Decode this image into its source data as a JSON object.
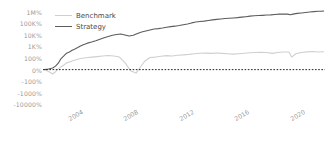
{
  "chart_data": {
    "type": "line",
    "title": "",
    "xlabel": "",
    "ylabel": "",
    "grid": false,
    "legend_position": "upper-left",
    "yscale": "symlog",
    "yticks": [
      {
        "label": "1M%",
        "value": 1000000
      },
      {
        "label": "100K%",
        "value": 100000
      },
      {
        "label": "10K%",
        "value": 10000
      },
      {
        "label": "1K%",
        "value": 1000
      },
      {
        "label": "100%",
        "value": 100
      },
      {
        "label": "0%",
        "value": 0
      },
      {
        "label": "-100%",
        "value": -100
      },
      {
        "label": "-1000%",
        "value": -1000
      },
      {
        "label": "-10000%",
        "value": -10000
      }
    ],
    "xticks": [
      "2004",
      "2008",
      "2012",
      "2016",
      "2020"
    ],
    "xlim": [
      2002.3,
      2022.6
    ],
    "ylim": [
      -30000,
      3000000
    ],
    "zero_line": {
      "value": 0,
      "style": "dotted",
      "color": "#222222"
    },
    "series": [
      {
        "name": "Benchmark",
        "color": "#cfcfcf",
        "x": [
          2002.4,
          2002.8,
          2003.0,
          2003.2,
          2003.4,
          2003.6,
          2003.8,
          2004.0,
          2004.3,
          2004.6,
          2005.0,
          2005.4,
          2005.8,
          2006.2,
          2006.6,
          2007.0,
          2007.4,
          2007.8,
          2008.2,
          2008.6,
          2009.0,
          2009.3,
          2009.6,
          2010.0,
          2010.4,
          2010.8,
          2011.2,
          2011.6,
          2012.0,
          2012.4,
          2012.8,
          2013.2,
          2013.6,
          2014.0,
          2014.4,
          2014.8,
          2015.2,
          2015.6,
          2016.0,
          2016.4,
          2016.8,
          2017.2,
          2017.6,
          2018.0,
          2018.4,
          2018.8,
          2019.2,
          2019.6,
          2020.0,
          2020.2,
          2020.5,
          2020.9,
          2021.3,
          2021.7,
          2022.1,
          2022.5
        ],
        "values": [
          0,
          -22,
          -38,
          -18,
          6,
          24,
          40,
          58,
          70,
          82,
          96,
          104,
          118,
          132,
          150,
          164,
          150,
          120,
          60,
          -10,
          -30,
          20,
          70,
          110,
          120,
          140,
          160,
          150,
          170,
          185,
          205,
          235,
          255,
          265,
          250,
          270,
          250,
          230,
          215,
          235,
          255,
          280,
          300,
          310,
          295,
          250,
          300,
          330,
          330,
          120,
          230,
          300,
          340,
          360,
          330,
          345
        ]
      },
      {
        "name": "Strategy",
        "color": "#5c5c5c",
        "x": [
          2002.4,
          2002.7,
          2003.0,
          2003.2,
          2003.4,
          2003.6,
          2003.8,
          2004.0,
          2004.2,
          2004.4,
          2004.6,
          2004.8,
          2005.0,
          2005.2,
          2005.5,
          2005.8,
          2006.1,
          2006.4,
          2006.7,
          2007.0,
          2007.3,
          2007.6,
          2007.9,
          2008.2,
          2008.5,
          2008.8,
          2009.1,
          2009.4,
          2009.7,
          2010.0,
          2010.3,
          2010.6,
          2010.9,
          2011.2,
          2011.5,
          2011.8,
          2012.1,
          2012.4,
          2012.7,
          2013.0,
          2013.3,
          2013.6,
          2013.9,
          2014.2,
          2014.5,
          2014.8,
          2015.1,
          2015.4,
          2015.7,
          2016.0,
          2016.3,
          2016.6,
          2016.9,
          2017.2,
          2017.5,
          2017.8,
          2018.1,
          2018.4,
          2018.7,
          2019.0,
          2019.3,
          2019.6,
          2019.9,
          2020.1,
          2020.3,
          2020.6,
          2020.9,
          2021.2,
          2021.5,
          2021.8,
          2022.1,
          2022.4,
          2022.5
        ],
        "values": [
          0,
          5,
          14,
          30,
          55,
          95,
          150,
          260,
          330,
          460,
          600,
          800,
          1100,
          1400,
          1900,
          2400,
          3100,
          4200,
          5600,
          7200,
          9000,
          10500,
          11500,
          9500,
          7800,
          9000,
          13000,
          17000,
          21000,
          26000,
          31000,
          34000,
          38000,
          44000,
          50000,
          55000,
          62000,
          72000,
          85000,
          105000,
          125000,
          140000,
          150000,
          170000,
          190000,
          210000,
          230000,
          250000,
          265000,
          280000,
          300000,
          330000,
          360000,
          400000,
          430000,
          450000,
          470000,
          500000,
          520000,
          560000,
          600000,
          620000,
          600000,
          520000,
          600000,
          700000,
          760000,
          820000,
          900000,
          980000,
          1050000,
          1080000,
          1100000
        ]
      }
    ]
  },
  "legend": {
    "items": [
      {
        "label": "Benchmark",
        "color": "#cfcfcf"
      },
      {
        "label": "Strategy",
        "color": "#5c5c5c"
      }
    ]
  }
}
